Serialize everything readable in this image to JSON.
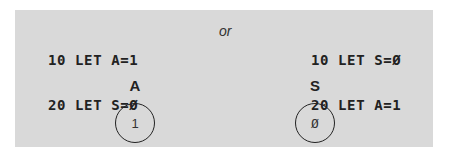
{
  "left_program": {
    "lines": [
      "10 LET A=1",
      "20 LET S=Ø",
      "--"
    ]
  },
  "separator": "or",
  "right_program": {
    "lines": [
      "10 LET S=Ø",
      "20 LET A=1",
      "--"
    ]
  },
  "variables": [
    {
      "name": "A",
      "value": "1"
    },
    {
      "name": "S",
      "value": "Ø"
    }
  ],
  "colors": {
    "panel": "#d9d9d9",
    "ink": "#222222"
  }
}
